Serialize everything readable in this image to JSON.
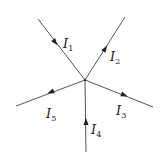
{
  "diagram": {
    "type": "current-junction",
    "junction": {
      "x": 85,
      "y": 80
    },
    "line_color": "#555555",
    "branches": [
      {
        "id": "I1",
        "symbol": "I",
        "subscript": "1",
        "end": {
          "x": 38,
          "y": 19
        },
        "direction": "into-junction",
        "arrow": {
          "x": 55,
          "y": 42
        },
        "label_pos": {
          "x": 63,
          "y": 48
        }
      },
      {
        "id": "I2",
        "symbol": "I",
        "subscript": "2",
        "end": {
          "x": 125,
          "y": 17
        },
        "direction": "out-of-junction",
        "arrow": {
          "x": 105,
          "y": 49
        },
        "label_pos": {
          "x": 110,
          "y": 61
        }
      },
      {
        "id": "I3",
        "symbol": "I",
        "subscript": "3",
        "end": {
          "x": 153,
          "y": 107
        },
        "direction": "out-of-junction",
        "arrow": {
          "x": 124,
          "y": 94
        },
        "label_pos": {
          "x": 116,
          "y": 115
        }
      },
      {
        "id": "I4",
        "symbol": "I",
        "subscript": "4",
        "end": {
          "x": 86,
          "y": 152
        },
        "direction": "into-junction",
        "arrow": {
          "x": 86,
          "y": 123
        },
        "label_pos": {
          "x": 91,
          "y": 134
        }
      },
      {
        "id": "I5",
        "symbol": "I",
        "subscript": "5",
        "end": {
          "x": 16,
          "y": 106
        },
        "direction": "out-of-junction",
        "arrow": {
          "x": 52,
          "y": 91
        },
        "label_pos": {
          "x": 46,
          "y": 118
        }
      }
    ]
  },
  "labels": {
    "I1": {
      "main": "I",
      "sub": "1"
    },
    "I2": {
      "main": "I",
      "sub": "2"
    },
    "I3": {
      "main": "I",
      "sub": "3"
    },
    "I4": {
      "main": "I",
      "sub": "4"
    },
    "I5": {
      "main": "I",
      "sub": "5"
    }
  }
}
